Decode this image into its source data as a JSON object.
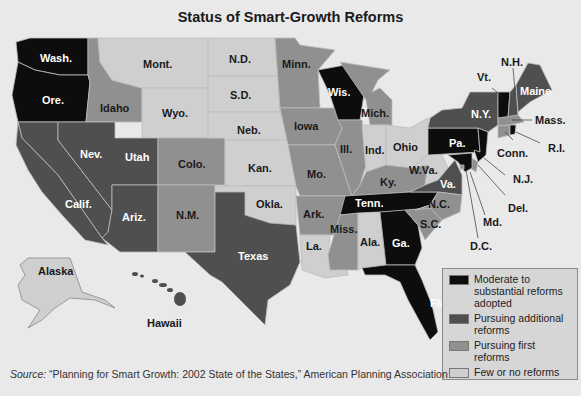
{
  "title": "Status of Smart-Growth Reforms",
  "colors": {
    "moderate_substantial": "#0d0d0d",
    "pursuing_additional": "#4f4f4f",
    "pursuing_first": "#909090",
    "few_or_none": "#cfcfcf",
    "background": "#e9e9e9"
  },
  "legend": {
    "items": [
      {
        "label": "Moderate to substantial reforms adopted",
        "line1": "Moderate to",
        "line2": "substantial reforms",
        "line3": "adopted",
        "color": "#0d0d0d"
      },
      {
        "label": "Pursuing additional reforms",
        "line1": "Pursuing additional",
        "line2": "reforms",
        "color": "#4f4f4f"
      },
      {
        "label": "Pursuing first reforms",
        "line1": "Pursuing first reforms",
        "color": "#909090"
      },
      {
        "label": "Few or no reforms",
        "line1": "Few or no reforms",
        "color": "#cfcfcf"
      }
    ]
  },
  "source": {
    "prefix": "Source:",
    "text": " “Planning for Smart Growth: 2002 State of the States,” American Planning Association"
  },
  "states": {
    "wash": {
      "label": "Wash.",
      "category": "Moderate to substantial reforms adopted"
    },
    "ore": {
      "label": "Ore.",
      "category": "Moderate to substantial reforms adopted"
    },
    "idaho": {
      "label": "Idaho",
      "category": "Pursuing first reforms"
    },
    "mont": {
      "label": "Mont.",
      "category": "Few or no reforms"
    },
    "wyo": {
      "label": "Wyo.",
      "category": "Few or no reforms"
    },
    "nd": {
      "label": "N.D.",
      "category": "Few or no reforms"
    },
    "sd": {
      "label": "S.D.",
      "category": "Few or no reforms"
    },
    "neb": {
      "label": "Neb.",
      "category": "Few or no reforms"
    },
    "kan": {
      "label": "Kan.",
      "category": "Few or no reforms"
    },
    "okla": {
      "label": "Okla.",
      "category": "Few or no reforms"
    },
    "texas": {
      "label": "Texas",
      "category": "Pursuing additional reforms"
    },
    "nev": {
      "label": "Nev.",
      "category": "Pursuing additional reforms"
    },
    "utah": {
      "label": "Utah",
      "category": "Pursuing additional reforms"
    },
    "calif": {
      "label": "Calif.",
      "category": "Pursuing additional reforms"
    },
    "ariz": {
      "label": "Ariz.",
      "category": "Pursuing additional reforms"
    },
    "colo": {
      "label": "Colo.",
      "category": "Pursuing first reforms"
    },
    "nm": {
      "label": "N.M.",
      "category": "Pursuing first reforms"
    },
    "minn": {
      "label": "Minn.",
      "category": "Pursuing first reforms"
    },
    "iowa": {
      "label": "Iowa",
      "category": "Pursuing first reforms"
    },
    "mo": {
      "label": "Mo.",
      "category": "Pursuing first reforms"
    },
    "ark": {
      "label": "Ark.",
      "category": "Pursuing first reforms"
    },
    "la": {
      "label": "La.",
      "category": "Few or no reforms"
    },
    "wis": {
      "label": "Wis.",
      "category": "Moderate to substantial reforms adopted"
    },
    "ill": {
      "label": "Ill.",
      "category": "Pursuing first reforms"
    },
    "mich": {
      "label": "Mich.",
      "category": "Pursuing first reforms"
    },
    "ind": {
      "label": "Ind.",
      "category": "Few or no reforms"
    },
    "ohio": {
      "label": "Ohio",
      "category": "Few or no reforms"
    },
    "ky": {
      "label": "Ky.",
      "category": "Pursuing first reforms"
    },
    "tenn": {
      "label": "Tenn.",
      "category": "Moderate to substantial reforms adopted"
    },
    "miss": {
      "label": "Miss.",
      "category": "Pursuing first reforms"
    },
    "ala": {
      "label": "Ala.",
      "category": "Few or no reforms"
    },
    "ga": {
      "label": "Ga.",
      "category": "Moderate to substantial reforms adopted"
    },
    "fla": {
      "label": "Fla.",
      "category": "Moderate to substantial reforms adopted"
    },
    "sc": {
      "label": "S.C.",
      "category": "Pursuing first reforms"
    },
    "nc": {
      "label": "N.C.",
      "category": "Pursuing first reforms"
    },
    "va": {
      "label": "Va.",
      "category": "Pursuing additional reforms"
    },
    "wva": {
      "label": "W.Va.",
      "category": "Few or no reforms"
    },
    "pa": {
      "label": "Pa.",
      "category": "Moderate to substantial reforms adopted"
    },
    "ny": {
      "label": "N.Y.",
      "category": "Pursuing additional reforms"
    },
    "vt": {
      "label": "Vt.",
      "category": "Moderate to substantial reforms adopted"
    },
    "nh": {
      "label": "N.H.",
      "category": "Pursuing additional reforms"
    },
    "maine": {
      "label": "Maine",
      "category": "Pursuing additional reforms"
    },
    "mass": {
      "label": "Mass.",
      "category": "Pursuing first reforms"
    },
    "ri": {
      "label": "R.I.",
      "category": "Moderate to substantial reforms adopted"
    },
    "conn": {
      "label": "Conn.",
      "category": "Pursuing first reforms"
    },
    "nj": {
      "label": "N.J.",
      "category": "Moderate to substantial reforms adopted"
    },
    "del": {
      "label": "Del.",
      "category": "Pursuing first reforms"
    },
    "md": {
      "label": "Md.",
      "category": "Moderate to substantial reforms adopted"
    },
    "dc": {
      "label": "D.C.",
      "category": "Pursuing first reforms"
    },
    "alaska": {
      "label": "Alaska",
      "category": "Few or no reforms"
    },
    "hawaii": {
      "label": "Hawaii",
      "category": "Pursuing additional reforms"
    }
  }
}
